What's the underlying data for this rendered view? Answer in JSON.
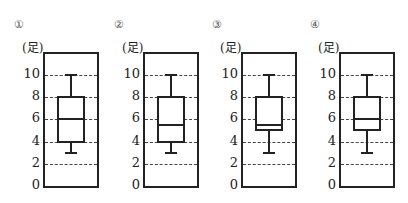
{
  "unit_label": "(足)",
  "y_ticks": [
    "0",
    "2",
    "4",
    "6",
    "8",
    "10"
  ],
  "panels": [
    {
      "label": "①"
    },
    {
      "label": "②"
    },
    {
      "label": "③"
    },
    {
      "label": "④"
    }
  ],
  "chart_data": {
    "type": "boxplot",
    "title": "",
    "ylabel": "(足)",
    "ylim": [
      0,
      12
    ],
    "y_ticks": [
      0,
      2,
      4,
      6,
      8,
      10
    ],
    "grid": "dashed horizontal at 2,4,6,8,10",
    "series": [
      {
        "name": "①",
        "min": 3,
        "q1": 4,
        "median": 6,
        "q3": 8,
        "max": 10
      },
      {
        "name": "②",
        "min": 3,
        "q1": 4,
        "median": 5.5,
        "q3": 8,
        "max": 10
      },
      {
        "name": "③",
        "min": 3,
        "q1": 5,
        "median": 5.5,
        "q3": 8,
        "max": 10
      },
      {
        "name": "④",
        "min": 3,
        "q1": 5,
        "median": 6,
        "q3": 8,
        "max": 10
      }
    ]
  }
}
